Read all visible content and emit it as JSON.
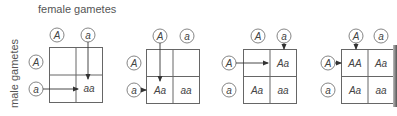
{
  "labels": {
    "female": "female gametes",
    "male": "male gametes"
  },
  "colors": {
    "line": "#555555",
    "text": "#444444"
  },
  "alleles": {
    "top": [
      "A",
      "a"
    ],
    "side": [
      "A",
      "a"
    ]
  },
  "panels": [
    {
      "step": 1,
      "cells": [
        "",
        "",
        "",
        "aa"
      ],
      "arrows": [
        "from female a down to cell aa",
        "from male a right to cell aa"
      ]
    },
    {
      "step": 2,
      "cells": [
        "",
        "",
        "Aa",
        "aa"
      ],
      "arrows": [
        "from female A down to cell Aa",
        "from male a right to cell Aa"
      ]
    },
    {
      "step": 3,
      "cells": [
        "",
        "Aa",
        "Aa",
        "aa"
      ],
      "arrows": [
        "from female a down to cell Aa",
        "from male A right to cell Aa"
      ]
    },
    {
      "step": 4,
      "cells": [
        "AA",
        "Aa",
        "Aa",
        "aa"
      ],
      "arrows": [
        "from female A down to cell AA",
        "from male A right to cell AA"
      ]
    }
  ]
}
